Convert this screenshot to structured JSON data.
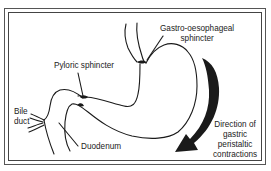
{
  "diagram": {
    "labels": {
      "gastro_oesophageal_line1": "Gastro-oesophageal",
      "gastro_oesophageal_line2": "sphincter",
      "pyloric": "Pyloric sphincter",
      "bile_line1": "Bile",
      "bile_line2": "duct",
      "duodenum": "Duodenum",
      "direction_line1": "Direction of",
      "direction_line2": "gastric",
      "direction_line3": "peristaltic",
      "direction_line4": "contractions"
    },
    "colors": {
      "line": "#1a1a1a",
      "arrow": "#1a1a1a",
      "background": "#ffffff",
      "frame": "#555555"
    }
  }
}
